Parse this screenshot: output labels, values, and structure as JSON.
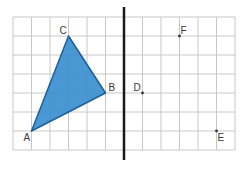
{
  "diagram": {
    "type": "reflection-grid",
    "grid": {
      "columns": 12,
      "rows": 7,
      "origin_px": [
        13,
        17
      ],
      "cell_w": 18.5,
      "cell_h": 19,
      "line_color": "#c8c8c8"
    },
    "mirror_line": {
      "grid_col": 6,
      "y_top_px": 7,
      "y_bottom_px": 160,
      "color": "#1a1a1a",
      "width": 2.5
    },
    "triangle": {
      "label": "ABC",
      "fill": "#3a8fd0",
      "stroke": "#1f5f96",
      "vertices": [
        {
          "name": "A",
          "col": 1,
          "row": 6,
          "label_dx": -8,
          "label_dy": 10
        },
        {
          "name": "B",
          "col": 5,
          "row": 4,
          "label_dx": 3,
          "label_dy": -2
        },
        {
          "name": "C",
          "col": 3,
          "row": 1,
          "label_dx": -9,
          "label_dy": -2
        }
      ]
    },
    "points": [
      {
        "name": "D",
        "col": 7,
        "row": 4,
        "label_dx": -9,
        "label_dy": -2
      },
      {
        "name": "F",
        "col": 9,
        "row": 1,
        "label_dx": 1,
        "label_dy": -2
      },
      {
        "name": "E",
        "col": 11,
        "row": 6,
        "label_dx": 1,
        "label_dy": 10
      }
    ],
    "point_color": "#333333",
    "label_color": "#3a3a3a"
  }
}
